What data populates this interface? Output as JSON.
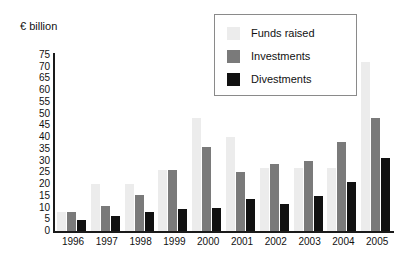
{
  "unit_label": "€ billion",
  "legend": {
    "position": "top-right",
    "entries": [
      {
        "label": "Funds raised",
        "color": "#ececec",
        "swatch": "legend-swatch-funds-raised"
      },
      {
        "label": "Investments",
        "color": "#7a7a7a",
        "swatch": "legend-swatch-investments"
      },
      {
        "label": "Divestments",
        "color": "#111111",
        "swatch": "legend-swatch-divestments"
      }
    ]
  },
  "chart_data": {
    "type": "bar",
    "title": "",
    "xlabel": "",
    "ylabel": "€ billion",
    "ylim": [
      0,
      75
    ],
    "yticks": [
      0,
      5,
      10,
      15,
      20,
      25,
      30,
      35,
      40,
      45,
      50,
      55,
      60,
      65,
      70,
      75
    ],
    "ytick_labels": [
      "0",
      "5",
      "10",
      "15",
      "20",
      "25",
      "30",
      "35",
      "40",
      "45",
      "50",
      "55",
      "60",
      "65",
      "70",
      "75"
    ],
    "grid": false,
    "categories": [
      "1996",
      "1997",
      "1998",
      "1999",
      "2000",
      "2001",
      "2002",
      "2003",
      "2004",
      "2005"
    ],
    "series": [
      {
        "name": "Funds raised",
        "color": "#ececec",
        "values": [
          8,
          20,
          20,
          26,
          48,
          40,
          27,
          27,
          27,
          72
        ]
      },
      {
        "name": "Investments",
        "color": "#7a7a7a",
        "values": [
          8,
          10.5,
          15.5,
          26,
          36,
          25,
          28.5,
          30,
          38,
          48
        ]
      },
      {
        "name": "Divestments",
        "color": "#111111",
        "values": [
          4.5,
          6.5,
          8,
          9.5,
          10,
          13.5,
          11.5,
          15,
          21,
          31
        ]
      }
    ]
  }
}
